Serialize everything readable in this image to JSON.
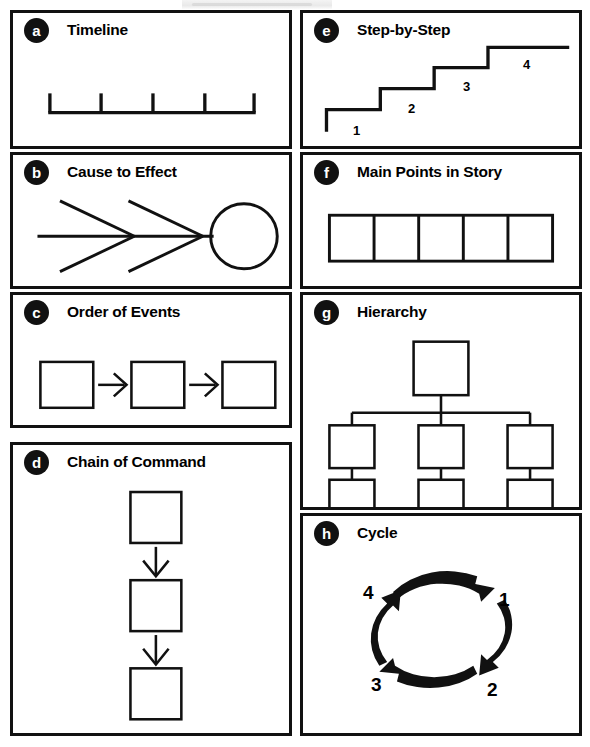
{
  "page": {
    "ink_color": "#111111",
    "background_color": "#ffffff"
  },
  "panels": [
    {
      "key": "a",
      "badge": "a",
      "title": "Timeline",
      "column": "left",
      "diagram": "timeline",
      "tick_count": 5,
      "labels": []
    },
    {
      "key": "b",
      "badge": "b",
      "title": "Cause to Effect",
      "column": "left",
      "diagram": "fishbone",
      "chevron_count": 2,
      "labels": []
    },
    {
      "key": "c",
      "badge": "c",
      "title": "Order of Events",
      "column": "left",
      "diagram": "sequence-boxes",
      "box_count": 3,
      "arrow_count": 2,
      "labels": []
    },
    {
      "key": "d",
      "badge": "d",
      "title": "Chain of Command",
      "column": "left",
      "diagram": "vertical-chain",
      "box_count": 3,
      "arrow_count": 2,
      "labels": []
    },
    {
      "key": "e",
      "badge": "e",
      "title": "Step-by-Step",
      "column": "right",
      "diagram": "staircase",
      "step_count": 4,
      "labels": [
        "1",
        "2",
        "3",
        "4"
      ]
    },
    {
      "key": "f",
      "badge": "f",
      "title": "Main Points in Story",
      "column": "right",
      "diagram": "box-strip",
      "box_count": 5,
      "labels": []
    },
    {
      "key": "g",
      "badge": "g",
      "title": "Hierarchy",
      "column": "right",
      "diagram": "org-tree",
      "root_count": 1,
      "child_count": 3,
      "grandchild_count": 3,
      "labels": []
    },
    {
      "key": "h",
      "badge": "h",
      "title": "Cycle",
      "column": "right",
      "diagram": "cycle-arrows",
      "arrow_count": 4,
      "labels": [
        "1",
        "2",
        "3",
        "4"
      ],
      "label_positions": {
        "1": "top-right",
        "2": "bottom-right",
        "3": "bottom-left",
        "4": "top-left"
      }
    }
  ]
}
